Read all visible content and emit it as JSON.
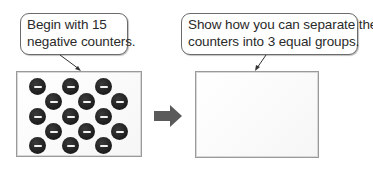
{
  "left_panel": {
    "callout_lines": [
      "Begin with 15",
      "negative counters."
    ],
    "counter_count": 15,
    "counter_symbol": "−",
    "counter_color": "#1c1c1c"
  },
  "arrow": {
    "icon": "right-arrow-icon",
    "color": "#5a5a5a"
  },
  "right_panel": {
    "callout_lines": [
      "Show how you can separate the",
      "counters into 3 equal groups."
    ]
  }
}
